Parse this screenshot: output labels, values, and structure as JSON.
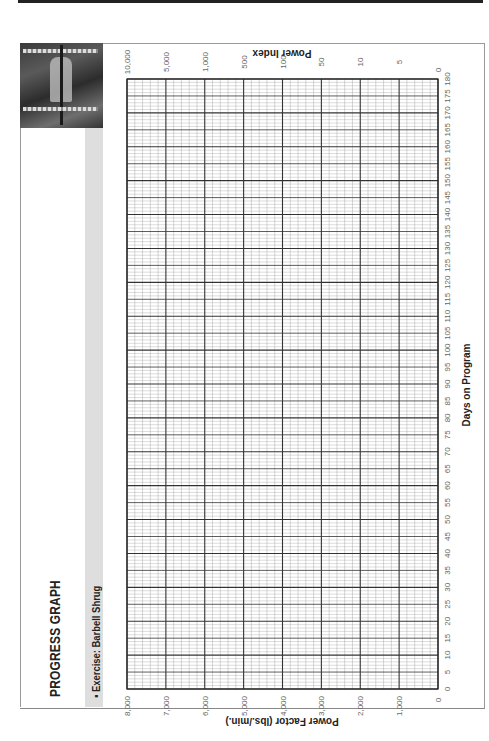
{
  "page": {
    "title": "PROGRESS GRAPH",
    "exercise_label": "▪ Exercise: Barbell Shrug",
    "photo": "barbell-shrug-photo"
  },
  "chart_data": {
    "type": "line",
    "title": "PROGRESS GRAPH",
    "subtitle": "Exercise: Barbell Shrug",
    "orientation": "rotated-90",
    "xlabel": "Days on Program",
    "ylabel": "Power Factor (lbs./min.)",
    "y2label": "Power Index",
    "x": {
      "range": [
        0,
        180
      ],
      "ticks": [
        0,
        5,
        10,
        15,
        20,
        25,
        30,
        35,
        40,
        45,
        50,
        55,
        60,
        65,
        70,
        75,
        80,
        85,
        90,
        95,
        100,
        105,
        110,
        115,
        120,
        125,
        130,
        135,
        140,
        145,
        150,
        155,
        160,
        165,
        170,
        175,
        180
      ],
      "major_every": 5
    },
    "y": {
      "range": [
        0,
        8000
      ],
      "ticks": [
        "0",
        "1,000",
        "2,000",
        "3,000",
        "4,000",
        "5,000",
        "6,000",
        "7,000",
        "8,000"
      ],
      "minor_per_major": 5
    },
    "y2": {
      "ticks": [
        "0",
        "5",
        "10",
        "50",
        "100",
        "500",
        "1,000",
        "5,000",
        "10,000"
      ]
    },
    "grid": true,
    "series": []
  }
}
